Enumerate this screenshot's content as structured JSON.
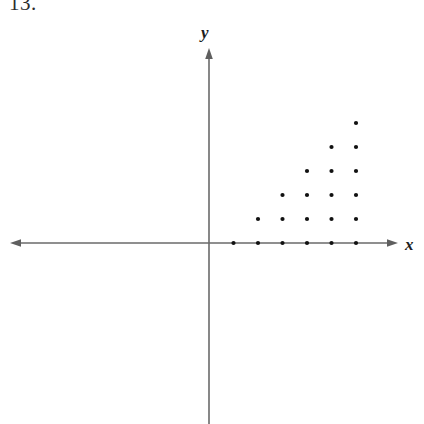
{
  "figure": {
    "problem_number": "13.",
    "background_color": "#ffffff",
    "axis_color": "#6a6a6a",
    "dot_color": "#111111",
    "label_color": "#1d1d1d",
    "x_axis_label": "x",
    "y_axis_label": "y",
    "origin_label": ""
  },
  "chart_data": {
    "type": "scatter",
    "title": "",
    "subtitle": "",
    "xlabel": "x",
    "ylabel": "y",
    "legend": [],
    "grid": false,
    "annotations": [],
    "point_count": 21,
    "xlim": [
      -8.2,
      7.8
    ],
    "ylim": [
      -7.5,
      8.2
    ],
    "x_unit_px": 24.5,
    "y_unit_px": 24.0,
    "origin_px": [
      209,
      243
    ],
    "rows": [
      {
        "y": 0,
        "x_values": [
          1,
          2,
          3,
          4,
          5,
          6
        ],
        "count": 6
      },
      {
        "y": 1,
        "x_values": [
          2,
          3,
          4,
          5,
          6
        ],
        "count": 5
      },
      {
        "y": 2,
        "x_values": [
          3,
          4,
          5,
          6
        ],
        "count": 4
      },
      {
        "y": 3,
        "x_values": [
          4,
          5,
          6
        ],
        "count": 3
      },
      {
        "y": 4,
        "x_values": [
          5,
          6
        ],
        "count": 2
      },
      {
        "y": 5,
        "x_values": [
          6
        ],
        "count": 1
      }
    ],
    "points": [
      [
        1,
        0
      ],
      [
        2,
        0
      ],
      [
        3,
        0
      ],
      [
        4,
        0
      ],
      [
        5,
        0
      ],
      [
        6,
        0
      ],
      [
        2,
        1
      ],
      [
        3,
        1
      ],
      [
        4,
        1
      ],
      [
        5,
        1
      ],
      [
        6,
        1
      ],
      [
        3,
        2
      ],
      [
        4,
        2
      ],
      [
        5,
        2
      ],
      [
        6,
        2
      ],
      [
        4,
        3
      ],
      [
        5,
        3
      ],
      [
        6,
        3
      ],
      [
        5,
        4
      ],
      [
        6,
        4
      ],
      [
        6,
        5
      ]
    ],
    "axes": {
      "x_axis": {
        "y_px": 243,
        "x_start_px": 10,
        "x_end_px": 398,
        "arrow_start": true,
        "arrow_end": true
      },
      "y_axis": {
        "x_px": 209,
        "y_start_px": 48,
        "y_end_px": 424,
        "arrow_start": true,
        "arrow_end": false
      }
    }
  }
}
